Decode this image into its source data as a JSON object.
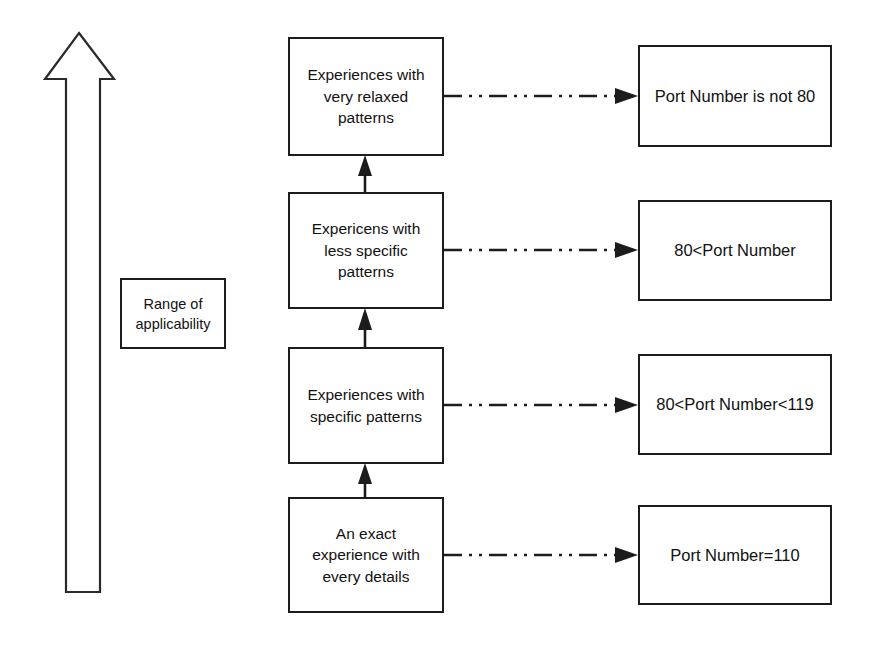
{
  "diagram": {
    "background_color": "#ffffff",
    "stroke_color": "#1c1c1c",
    "text_color": "#111111",
    "range_arrow": {
      "label": "Range of applicability",
      "direction": "up",
      "icon": "up-arrow-icon"
    },
    "levels": [
      {
        "id": "very-relaxed",
        "label": "Experiences with\nvery relaxed\npatterns",
        "condition": "Port Number is not 80"
      },
      {
        "id": "less-specific",
        "label": "Expericens with\nless specific\npatterns",
        "condition": "80<Port Number"
      },
      {
        "id": "specific",
        "label": "Experiences with\nspecific patterns",
        "condition": "80<Port Number<119"
      },
      {
        "id": "exact",
        "label": "An exact\nexperience with\nevery details",
        "condition": "Port Number=110"
      }
    ],
    "connectors": {
      "vertical_style": "solid-arrow-up",
      "horizontal_style": "dash-dot-dot-arrow-right"
    }
  }
}
